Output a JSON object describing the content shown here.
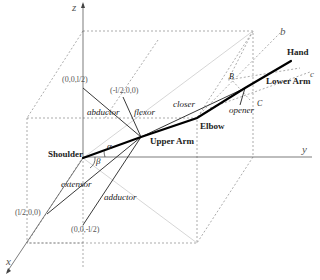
{
  "diagram": {
    "type": "3d-arm-kinematics",
    "axes": {
      "x": "x",
      "y": "y",
      "z": "z",
      "b": "b",
      "c": "c"
    },
    "joints": {
      "shoulder": "Shoulder",
      "upper_arm": "Upper Arm",
      "elbow": "Elbow",
      "lower_arm": "Lower Arm",
      "hand": "Hand"
    },
    "muscles": {
      "abductor": "abductor",
      "flexor": "flexor",
      "extensor": "extensor",
      "adductor": "adductor",
      "closer": "closer",
      "opener": "opener"
    },
    "coordinates": {
      "z_half": "(0,0,l/2)",
      "neg_x_half": "(-l/2,0,0)",
      "x_half": "(l/2,0,0)",
      "neg_z_half": "(0,0,-l/2)"
    },
    "angles": {
      "alpha": "α",
      "beta": "β"
    },
    "points": {
      "B": "B",
      "C": "C"
    },
    "colors": {
      "line": "#111111",
      "dashed": "#888888",
      "light": "#cccccc",
      "text": "#222222"
    }
  }
}
